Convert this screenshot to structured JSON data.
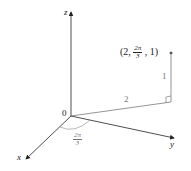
{
  "axes": {
    "x_label": "x",
    "y_label": "y",
    "z_label": "z",
    "origin_label": "0"
  },
  "point": {
    "label_open": "(2,",
    "theta_num": "2π",
    "theta_den": "3",
    "label_close": ", 1)"
  },
  "segments": {
    "radial_length": "2",
    "height_length": "1"
  },
  "angle": {
    "num": "2π",
    "den": "3"
  },
  "colors": {
    "axis": "#222222",
    "construction": "#666666",
    "angle_label": "#777777"
  }
}
